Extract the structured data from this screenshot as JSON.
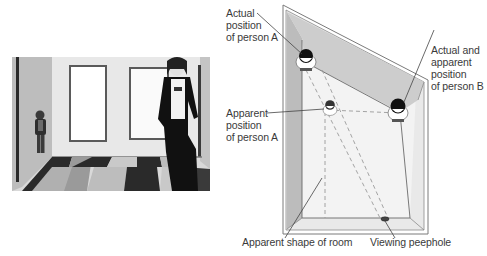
{
  "photo": {
    "description": "Ames room photograph: small boy standing in left corner, tall girl standing on right, checkered floor, two framed windows on back wall"
  },
  "diagram": {
    "labels": {
      "actual_a": [
        "Actual",
        "position",
        "of person A"
      ],
      "apparent_a": [
        "Apparent",
        "position",
        "of person A"
      ],
      "actual_b": [
        "Actual and",
        "apparent",
        "position",
        "of person B"
      ],
      "room_shape": "Apparent shape of room",
      "peephole": "Viewing peephole"
    },
    "colors": {
      "wall_shade": "#c8c8c8",
      "floor": "#f2f2f2",
      "outline": "#7a7a7a",
      "dashed": "#9a9a9a",
      "head": "#111111"
    }
  }
}
